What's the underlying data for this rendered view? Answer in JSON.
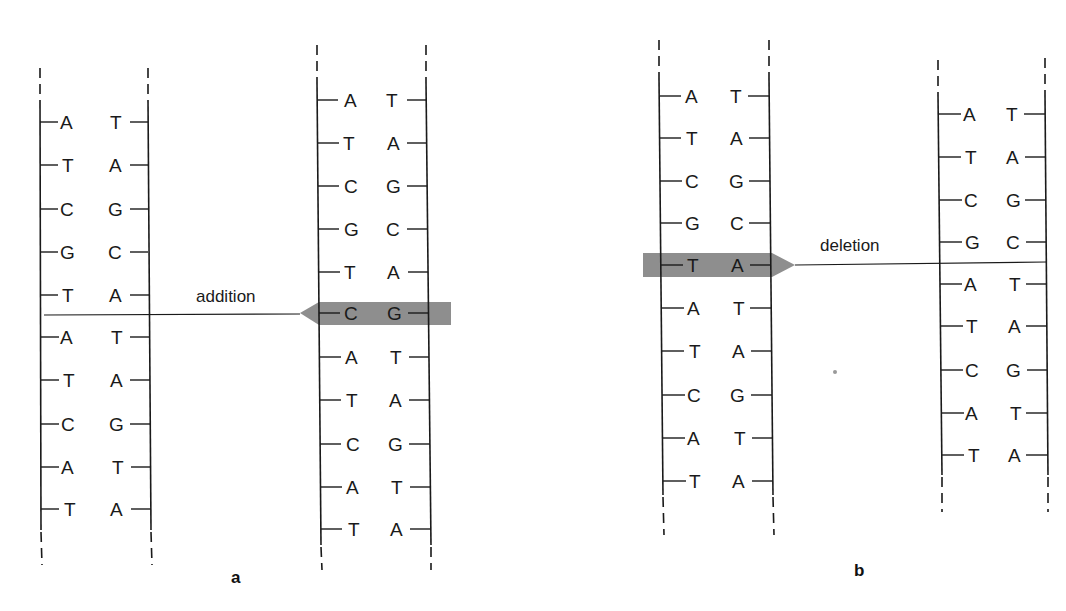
{
  "figure": {
    "panels": [
      {
        "id": "a",
        "label": "a",
        "mutation_label": "addition",
        "original_strand": {
          "pairs": [
            [
              "A",
              "T"
            ],
            [
              "T",
              "A"
            ],
            [
              "C",
              "G"
            ],
            [
              "G",
              "C"
            ],
            [
              "T",
              "A"
            ],
            [
              "A",
              "T"
            ],
            [
              "T",
              "A"
            ],
            [
              "C",
              "G"
            ],
            [
              "A",
              "T"
            ],
            [
              "T",
              "A"
            ]
          ]
        },
        "mutated_strand": {
          "pairs": [
            [
              "A",
              "T"
            ],
            [
              "T",
              "A"
            ],
            [
              "C",
              "G"
            ],
            [
              "G",
              "C"
            ],
            [
              "T",
              "A"
            ],
            [
              "C",
              "G"
            ],
            [
              "A",
              "T"
            ],
            [
              "T",
              "A"
            ],
            [
              "C",
              "G"
            ],
            [
              "A",
              "T"
            ],
            [
              "T",
              "A"
            ]
          ],
          "highlighted_pair_index": 5
        }
      },
      {
        "id": "b",
        "label": "b",
        "mutation_label": "deletion",
        "original_strand": {
          "pairs": [
            [
              "A",
              "T"
            ],
            [
              "T",
              "A"
            ],
            [
              "C",
              "G"
            ],
            [
              "G",
              "C"
            ],
            [
              "T",
              "A"
            ],
            [
              "A",
              "T"
            ],
            [
              "T",
              "A"
            ],
            [
              "C",
              "G"
            ],
            [
              "A",
              "T"
            ],
            [
              "T",
              "A"
            ]
          ],
          "highlighted_pair_index": 4
        },
        "mutated_strand": {
          "pairs": [
            [
              "A",
              "T"
            ],
            [
              "T",
              "A"
            ],
            [
              "C",
              "G"
            ],
            [
              "G",
              "C"
            ],
            [
              "A",
              "T"
            ],
            [
              "T",
              "A"
            ],
            [
              "C",
              "G"
            ],
            [
              "A",
              "T"
            ],
            [
              "T",
              "A"
            ]
          ]
        }
      }
    ],
    "colors": {
      "ink": "#1a1a1a",
      "highlight": "#8e8e8e",
      "background": "#ffffff"
    }
  }
}
